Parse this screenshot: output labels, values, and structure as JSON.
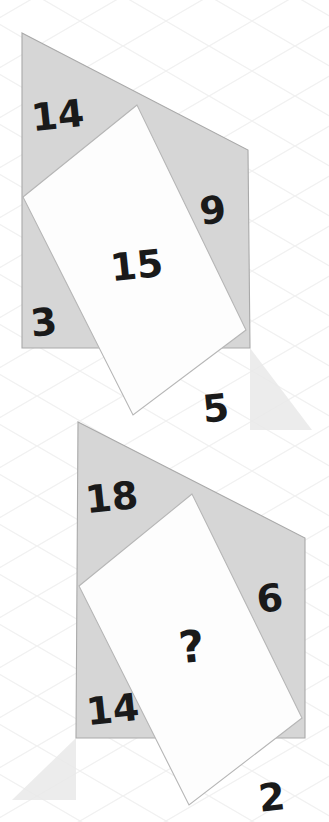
{
  "puzzle": {
    "title": "Isometric number puzzle",
    "background": {
      "color": "#ffffff",
      "grid_color": "#f2f2f2",
      "grid_type": "isometric-diamond"
    },
    "palette": {
      "face_fill": "#d6d6d6",
      "face_stroke": "#a8a8a8",
      "inner_fill": "#fdfdfd",
      "inner_stroke": "#b4b4b4",
      "shadow_fill": "#e8e8e8",
      "text_color": "#1a1a1a"
    },
    "shapes": [
      {
        "id": "shape-top",
        "name": "top-diamond",
        "labels": {
          "top_left": "14",
          "top_right": "9",
          "bottom_left": "3",
          "bottom_right": "5",
          "center": "15"
        },
        "outline": "22,33 248,150 250,348 22,348",
        "inner": "137,105 23,197 133,415 246,330",
        "shadow": "250,348 250,430 312,430",
        "label_positions": {
          "top_left": {
            "x": 58,
            "y": 118,
            "size": 38,
            "rot": -6
          },
          "top_right": {
            "x": 213,
            "y": 213,
            "size": 38,
            "rot": -6
          },
          "bottom_left": {
            "x": 44,
            "y": 325,
            "size": 38,
            "rot": -6
          },
          "bottom_right": {
            "x": 216,
            "y": 411,
            "size": 38,
            "rot": -6
          },
          "center": {
            "x": 137,
            "y": 268,
            "size": 38,
            "rot": -6
          }
        }
      },
      {
        "id": "shape-bottom",
        "name": "bottom-diamond",
        "labels": {
          "top_left": "18",
          "top_right": "6",
          "bottom_left": "14",
          "bottom_right": "2",
          "center": "?"
        },
        "outline": "78,422 305,538 305,738 76,738",
        "inner": "192,494 79,586 189,805 302,718",
        "shadow": "76,738 76,800 12,800",
        "label_positions": {
          "top_left": {
            "x": 112,
            "y": 500,
            "size": 38,
            "rot": -6
          },
          "top_right": {
            "x": 270,
            "y": 601,
            "size": 38,
            "rot": -6
          },
          "bottom_left": {
            "x": 113,
            "y": 712,
            "size": 38,
            "rot": -6
          },
          "bottom_right": {
            "x": 272,
            "y": 800,
            "size": 38,
            "rot": -6
          },
          "center": {
            "x": 192,
            "y": 650,
            "size": 44,
            "rot": -6
          }
        }
      }
    ]
  }
}
